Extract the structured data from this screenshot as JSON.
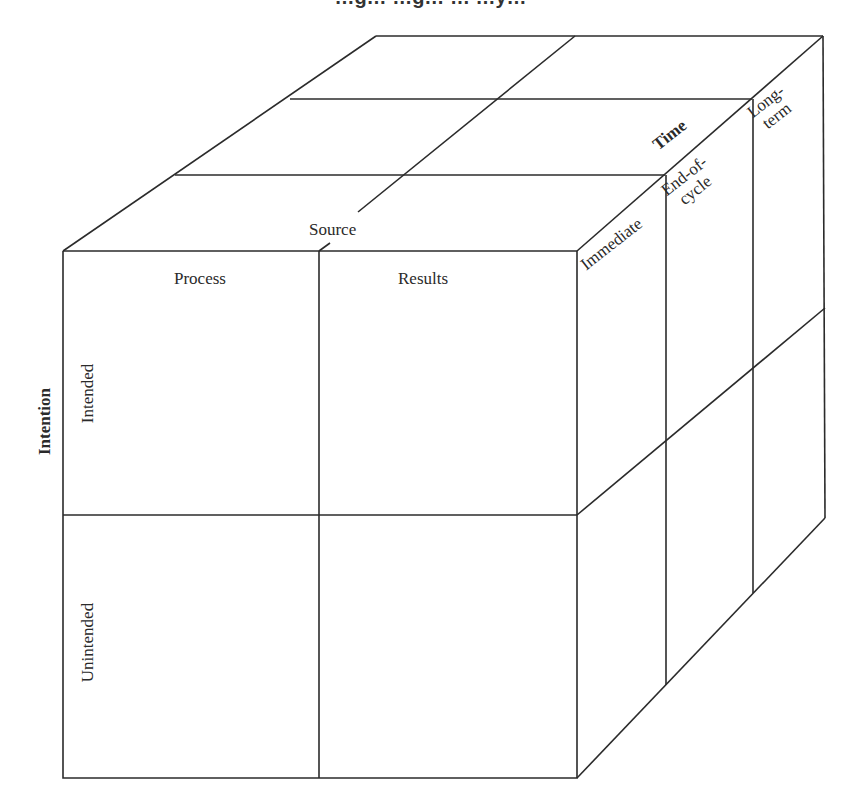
{
  "figure": {
    "title_partial": "…g… …g… … …y…",
    "axes": {
      "source": {
        "label": "Source",
        "categories": [
          "Process",
          "Results"
        ]
      },
      "intention": {
        "label": "Intention",
        "categories": [
          "Intended",
          "Unintended"
        ]
      },
      "time": {
        "label": "Time",
        "categories": [
          "Immediate",
          "End-of-\ncycle",
          "Long-\nterm"
        ]
      }
    },
    "line_color": "#2b2b2b",
    "background": "#ffffff"
  }
}
